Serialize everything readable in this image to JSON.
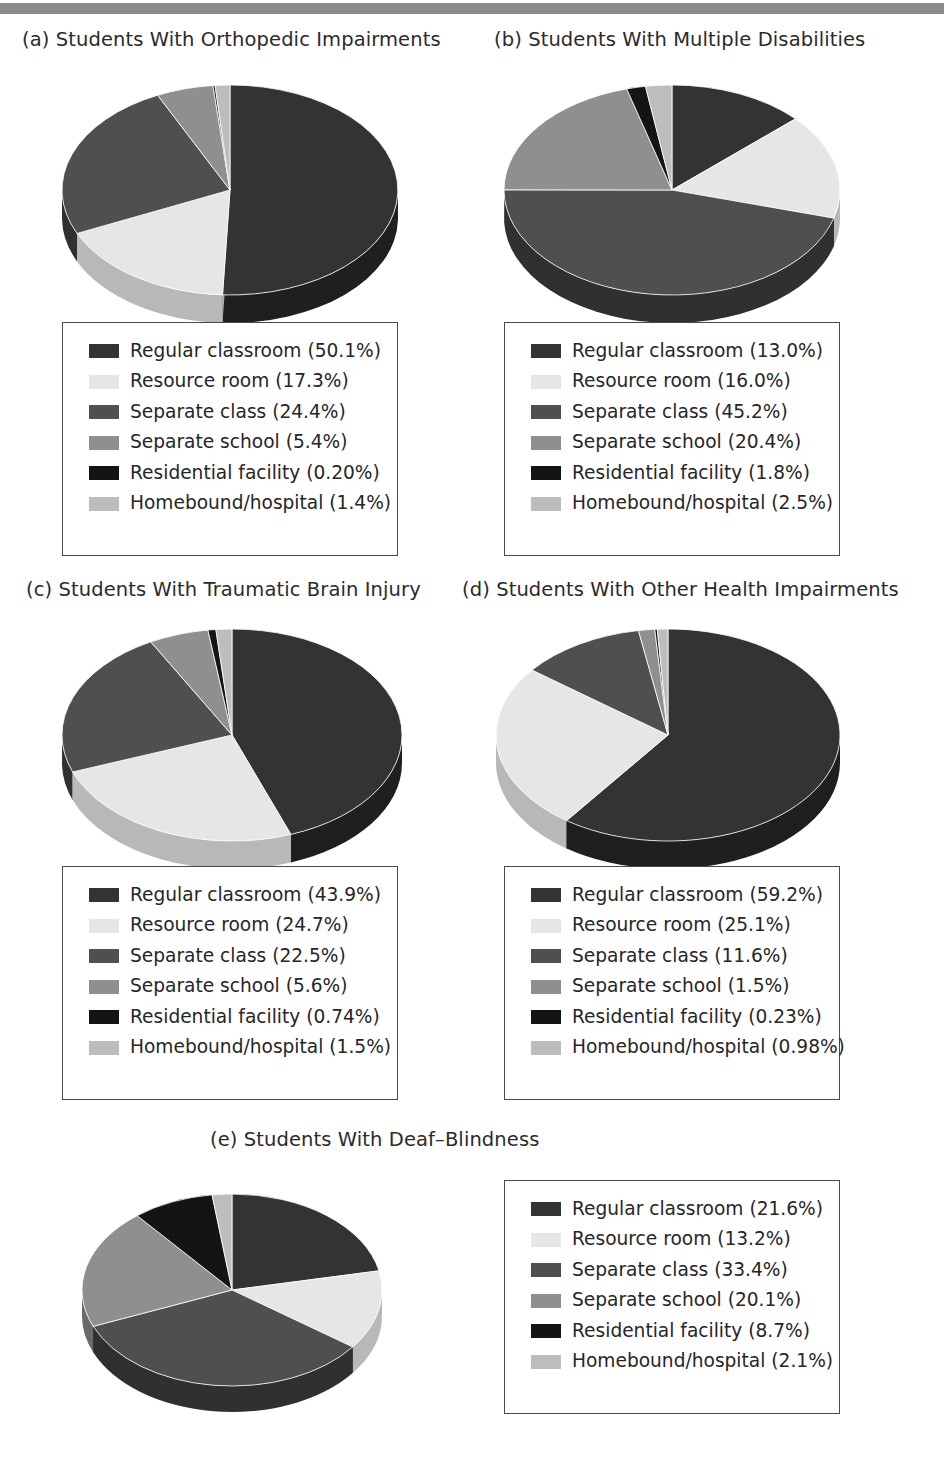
{
  "banner": {
    "present": true,
    "color": "#8c8c8c"
  },
  "palette": {
    "regular_classroom": "#333333",
    "resource_room": "#e6e6e6",
    "separate_class": "#4f4f4f",
    "separate_school": "#8f8f8f",
    "residential_facility": "#141414",
    "homebound_hospital": "#bdbdbd",
    "side_regular_classroom": "#1f1f1f",
    "side_resource_room": "#b8b8b8",
    "side_separate_class": "#303030",
    "side_separate_school": "#6a6a6a",
    "side_residential_facility": "#000000",
    "side_homebound_hospital": "#949494",
    "box_border": "#4a4a4a",
    "text": "#262626"
  },
  "categories": [
    "Regular classroom",
    "Resource room",
    "Separate class",
    "Separate school",
    "Residential facility",
    "Homebound/hospital"
  ],
  "chart_data": [
    {
      "type": "pie",
      "id": "a",
      "title": "(a) Students With Orthopedic Impairments",
      "categories": [
        "Regular classroom",
        "Resource room",
        "Separate class",
        "Separate school",
        "Residential facility",
        "Homebound/hospital"
      ],
      "values": [
        50.1,
        17.3,
        24.4,
        5.4,
        0.2,
        1.4
      ],
      "labels": [
        "Regular classroom (50.1%)",
        "Resource room (17.3%)",
        "Separate class (24.4%)",
        "Separate school (5.4%)",
        "Residential facility (0.20%)",
        "Homebound/hospital (1.4%)"
      ],
      "legend_position": "below"
    },
    {
      "type": "pie",
      "id": "b",
      "title": "(b) Students With Multiple Disabilities",
      "categories": [
        "Regular classroom",
        "Resource room",
        "Separate class",
        "Separate school",
        "Residential facility",
        "Homebound/hospital"
      ],
      "values": [
        13.0,
        16.0,
        45.2,
        20.4,
        1.8,
        2.5
      ],
      "labels": [
        "Regular classroom (13.0%)",
        "Resource room (16.0%)",
        "Separate class (45.2%)",
        "Separate school (20.4%)",
        "Residential facility (1.8%)",
        "Homebound/hospital (2.5%)"
      ],
      "legend_position": "below"
    },
    {
      "type": "pie",
      "id": "c",
      "title": "(c) Students With Traumatic Brain Injury",
      "categories": [
        "Regular classroom",
        "Resource room",
        "Separate class",
        "Separate school",
        "Residential facility",
        "Homebound/hospital"
      ],
      "values": [
        43.9,
        24.7,
        22.5,
        5.6,
        0.74,
        1.5
      ],
      "labels": [
        "Regular classroom (43.9%)",
        "Resource room (24.7%)",
        "Separate class (22.5%)",
        "Separate school (5.6%)",
        "Residential facility (0.74%)",
        "Homebound/hospital (1.5%)"
      ],
      "legend_position": "below"
    },
    {
      "type": "pie",
      "id": "d",
      "title": "(d) Students With Other Health Impairments",
      "categories": [
        "Regular classroom",
        "Resource room",
        "Separate class",
        "Separate school",
        "Residential facility",
        "Homebound/hospital"
      ],
      "values": [
        59.2,
        25.1,
        11.6,
        1.5,
        0.23,
        0.98
      ],
      "labels": [
        "Regular classroom (59.2%)",
        "Resource room (25.1%)",
        "Separate class (11.6%)",
        "Separate school (1.5%)",
        "Residential facility (0.23%)",
        "Homebound/hospital (0.98%)"
      ],
      "legend_position": "below"
    },
    {
      "type": "pie",
      "id": "e",
      "title": "(e) Students With Deaf–Blindness",
      "categories": [
        "Regular classroom",
        "Resource room",
        "Separate class",
        "Separate school",
        "Residential facility",
        "Homebound/hospital"
      ],
      "values": [
        21.6,
        13.2,
        33.4,
        20.1,
        8.7,
        2.1
      ],
      "labels": [
        "Regular classroom (21.6%)",
        "Resource room (13.2%)",
        "Separate class (33.4%)",
        "Separate school (20.1%)",
        "Residential facility (8.7%)",
        "Homebound/hospital (2.1%)"
      ],
      "legend_position": "right"
    }
  ],
  "layout": {
    "panels": [
      {
        "id": "a",
        "title_x": 22,
        "title_y": 28,
        "pie_cx": 230,
        "pie_cy": 190,
        "pie_rx": 168,
        "pie_ry": 105,
        "depth": 28,
        "legend_x": 62,
        "legend_y": 322,
        "legend_w": 336,
        "legend_h": 234
      },
      {
        "id": "b",
        "title_x": 494,
        "title_y": 28,
        "pie_cx": 672,
        "pie_cy": 190,
        "pie_rx": 168,
        "pie_ry": 105,
        "depth": 28,
        "legend_x": 504,
        "legend_y": 322,
        "legend_w": 336,
        "legend_h": 234
      },
      {
        "id": "c",
        "title_x": 26,
        "title_y": 578,
        "pie_cx": 232,
        "pie_cy": 735,
        "pie_rx": 170,
        "pie_ry": 106,
        "depth": 28,
        "legend_x": 62,
        "legend_y": 866,
        "legend_w": 336,
        "legend_h": 234
      },
      {
        "id": "d",
        "title_x": 462,
        "title_y": 578,
        "pie_cx": 668,
        "pie_cy": 735,
        "pie_rx": 172,
        "pie_ry": 106,
        "depth": 28,
        "legend_x": 504,
        "legend_y": 866,
        "legend_w": 336,
        "legend_h": 234
      },
      {
        "id": "e",
        "title_x": 210,
        "title_y": 1128,
        "pie_cx": 232,
        "pie_cy": 1290,
        "pie_rx": 150,
        "pie_ry": 96,
        "depth": 26,
        "legend_x": 504,
        "legend_y": 1180,
        "legend_w": 336,
        "legend_h": 234
      }
    ]
  }
}
